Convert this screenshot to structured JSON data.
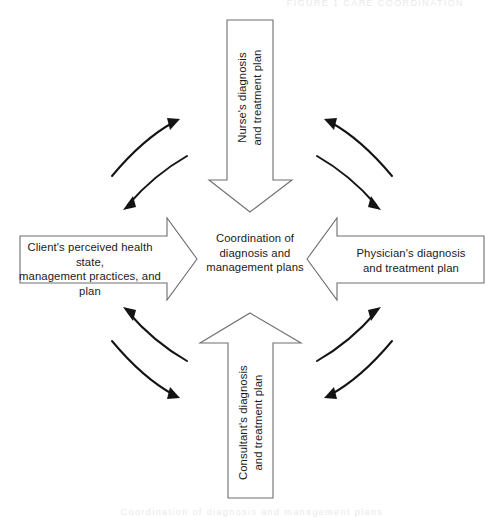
{
  "diagram": {
    "center": {
      "text": "Coordination of\ndiagnosis and\nmanagement plans"
    },
    "arrows": [
      {
        "id": "top",
        "direction": "down",
        "text": "Nurse's diagnosis\nand treatment plan"
      },
      {
        "id": "left",
        "direction": "right",
        "text": "Client's perceived health state,\nmanagement practices, and plan"
      },
      {
        "id": "right",
        "direction": "left",
        "text": "Physician's diagnosis\nand treatment plan"
      },
      {
        "id": "bottom",
        "direction": "up",
        "text": "Consultant's diagnosis\nand treatment plan"
      }
    ],
    "curved_arrow_pairs": [
      {
        "id": "top-left",
        "count": 2,
        "description": "bidirectional curved arrows"
      },
      {
        "id": "top-right",
        "count": 2,
        "description": "bidirectional curved arrows"
      },
      {
        "id": "bottom-left",
        "count": 2,
        "description": "bidirectional curved arrows"
      },
      {
        "id": "bottom-right",
        "count": 2,
        "description": "bidirectional curved arrows"
      }
    ],
    "edge_captions": {
      "top": "FIGURE 1 CARE COORDINATION",
      "bottom": "Coordination of diagnosis and management plans"
    },
    "colors": {
      "arrow_outline": "#6e6e72",
      "arrow_fill": "#ffffff",
      "curve_stroke": "#141414",
      "text": "#1a1a1a",
      "background": "#ffffff"
    }
  }
}
